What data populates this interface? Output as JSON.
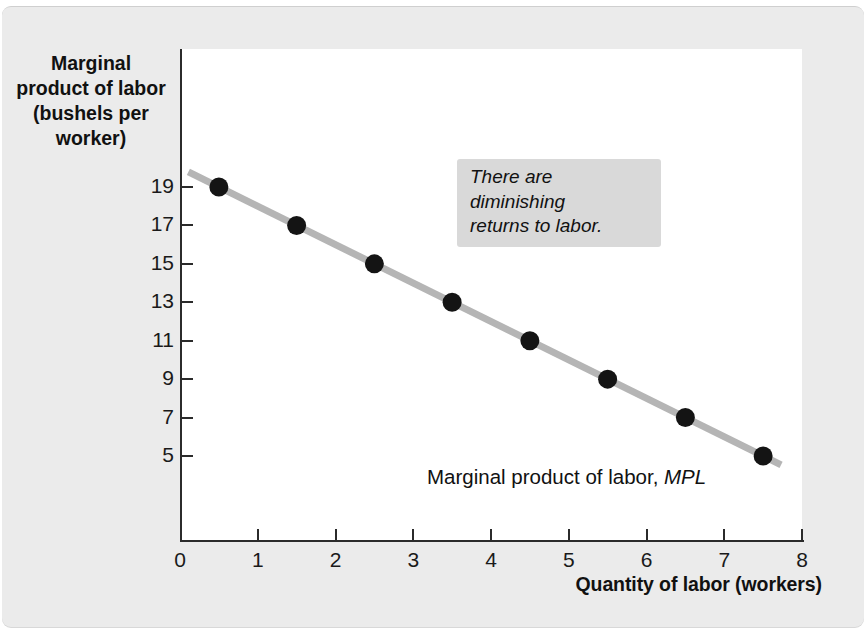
{
  "chart_data": {
    "type": "line",
    "title": "",
    "subtitle": "",
    "xlabel": "Quantity of labor (workers)",
    "ylabel": "Marginal product of labor (bushels per worker)",
    "ylabel_lines": [
      "Marginal",
      "product of labor",
      "(bushels per",
      "worker)"
    ],
    "x": [
      0.5,
      1.5,
      2.5,
      3.5,
      4.5,
      5.5,
      6.5,
      7.5
    ],
    "values": [
      19,
      17,
      15,
      13,
      11,
      9,
      7,
      5
    ],
    "series": [
      {
        "name": "Marginal product of labor, MPL",
        "x": [
          0.5,
          1.5,
          2.5,
          3.5,
          4.5,
          5.5,
          6.5,
          7.5
        ],
        "values": [
          19,
          17,
          15,
          13,
          11,
          9,
          7,
          5
        ]
      }
    ],
    "xlim": [
      0,
      8
    ],
    "ylim": [
      0,
      20
    ],
    "xticks": [
      0,
      1,
      2,
      3,
      4,
      5,
      6,
      7,
      8
    ],
    "xticklabels": [
      "0",
      "1",
      "2",
      "3",
      "4",
      "5",
      "6",
      "7",
      "8"
    ],
    "yticks": [
      5,
      7,
      9,
      11,
      13,
      15,
      17,
      19
    ],
    "yticklabels": [
      "19",
      "17",
      "15",
      "13",
      "11",
      "9",
      "7",
      "5"
    ],
    "grid": false,
    "legend_position": "none",
    "line_color": "#b5b5b5",
    "marker_color": "#141414",
    "plot_background": "#ffffff",
    "figure_background": "#ebebeb",
    "annotations": [
      {
        "text": "There are diminishing returns to labor.",
        "line_1": "There are diminishing",
        "line_2": "returns to labor.",
        "style": "italic",
        "background": "#d9d9d9"
      },
      {
        "text": "Marginal product of labor, MPL",
        "plain_part": "Marginal product of labor, ",
        "italic_part": "MPL",
        "style": "curve-label"
      }
    ]
  },
  "axes": {
    "y_title_lines": [
      "Marginal",
      "product of labor",
      "(bushels per",
      "worker)"
    ],
    "x_title": "Quantity of labor (workers)",
    "origin_label": "0"
  }
}
